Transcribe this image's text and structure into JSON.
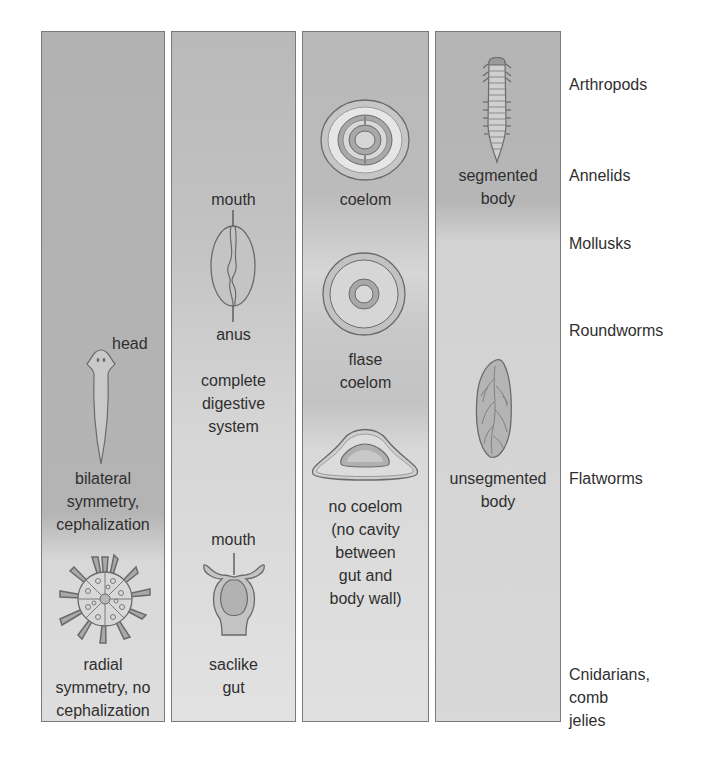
{
  "columns": [
    {
      "name": "symmetry",
      "labels": {
        "head": "head",
        "bilateral": "bilateral\nsymmetry,\ncephalization",
        "radial": "radial\nsymmetry, no\ncephalization"
      },
      "icons": [
        "flatworm-icon",
        "radial-organism-icon"
      ]
    },
    {
      "name": "digestive",
      "labels": {
        "mouth_top": "mouth",
        "anus": "anus",
        "complete": "complete\ndigestive\nsystem",
        "mouth_bottom": "mouth",
        "saclike": "saclike\ngut"
      },
      "icons": [
        "complete-gut-icon",
        "saclike-gut-icon"
      ]
    },
    {
      "name": "body-cavity",
      "labels": {
        "coelom": "coelom",
        "false_coelom": "flase\ncoelom",
        "no_coelom": "no coelom\n(no cavity\nbetween\ngut and\nbody wall)"
      },
      "icons": [
        "coelom-cross-section-icon",
        "false-coelom-cross-section-icon",
        "no-coelom-cross-section-icon"
      ]
    },
    {
      "name": "segmentation",
      "labels": {
        "segmented": "segmented\nbody",
        "unsegmented": "unsegmented\nbody"
      },
      "icons": [
        "segmented-worm-icon",
        "unsegmented-body-icon"
      ]
    }
  ],
  "phyla": [
    "Arthropods",
    "Annelids",
    "Mollusks",
    "Roundworms",
    "Flatworms",
    "Cnidarians,\ncomb\njelies"
  ],
  "colors": {
    "column_border": "#7a7a7a",
    "text": "#2f2f2f",
    "outline": "#6a6a6a"
  }
}
